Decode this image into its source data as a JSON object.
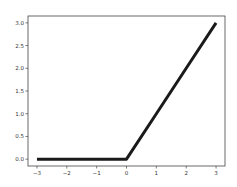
{
  "chart_data": {
    "type": "line",
    "title": "",
    "xlabel": "",
    "ylabel": "",
    "xlim": [
      -3.3,
      3.3
    ],
    "ylim": [
      -0.15,
      3.15
    ],
    "grid": false,
    "legend": null,
    "x_ticks": [
      -3,
      -2,
      -1,
      0,
      1,
      2,
      3
    ],
    "x_tick_labels": [
      "−3",
      "−2",
      "−1",
      "0",
      "1",
      "2",
      "3"
    ],
    "y_ticks": [
      0.0,
      0.5,
      1.0,
      1.5,
      2.0,
      2.5,
      3.0
    ],
    "y_tick_labels": [
      "0.0",
      "0.5",
      "1.0",
      "1.5",
      "2.0",
      "2.5",
      "3.0"
    ],
    "series": [
      {
        "name": "relu",
        "color": "#1a1a1a",
        "x": [
          -3,
          -2,
          -1,
          0,
          1,
          2,
          3
        ],
        "y": [
          0,
          0,
          0,
          0,
          1,
          2,
          3
        ]
      }
    ]
  }
}
